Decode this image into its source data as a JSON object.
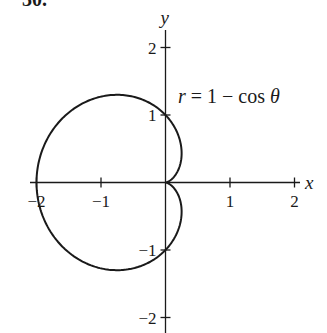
{
  "problem_number": "30.",
  "chart_data": {
    "type": "line",
    "title": "",
    "equation": "r = 1 − cos θ",
    "curve": {
      "kind": "polar",
      "r": "1 - cos(theta)",
      "theta_range": [
        0,
        6.283185307
      ]
    },
    "xlabel": "x",
    "ylabel": "y",
    "xlim": [
      -2,
      2
    ],
    "ylim": [
      -2,
      2
    ],
    "x_ticks": [
      -2,
      -1,
      1,
      2
    ],
    "x_tick_labels": [
      "−2",
      "−1",
      "1",
      "2"
    ],
    "y_ticks": [
      -2,
      -1,
      1,
      2
    ],
    "y_tick_labels": [
      "−2",
      "−1",
      "1",
      "2"
    ],
    "key_points": [
      {
        "label": "left intercept",
        "x": -2,
        "y": 0
      },
      {
        "label": "top intercept",
        "x": 0,
        "y": 1
      },
      {
        "label": "bottom intercept",
        "x": 0,
        "y": -1
      },
      {
        "label": "cusp",
        "x": 0,
        "y": 0
      },
      {
        "label": "max y",
        "x": -0.75,
        "y": 1.299
      },
      {
        "label": "min y",
        "x": -0.75,
        "y": -1.299
      }
    ],
    "grid": false,
    "legend": "none"
  },
  "layout": {
    "origin_px": [
      165.5,
      182.5
    ],
    "unit_x_px": 64.5,
    "unit_y_px": 67.5,
    "x_axis_extent_px": [
      30,
      300
    ],
    "y_axis_extent_px": [
      30,
      333
    ]
  }
}
